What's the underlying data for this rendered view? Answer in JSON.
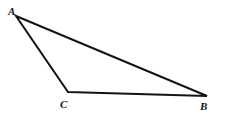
{
  "figure": {
    "name": "triangle-abc",
    "width": 225,
    "height": 119,
    "background_color": "#ffffff",
    "stroke_color": "#141414",
    "stroke_width": 2,
    "vertices": [
      {
        "id": "A",
        "label": "A",
        "x": 16,
        "y": 16,
        "label_x": 8,
        "label_y": 6
      },
      {
        "id": "B",
        "label": "B",
        "x": 207,
        "y": 96,
        "label_x": 200,
        "label_y": 101
      },
      {
        "id": "C",
        "label": "C",
        "x": 68,
        "y": 92,
        "label_x": 60,
        "label_y": 99
      }
    ],
    "edges": [
      {
        "id": "AB",
        "from": "A",
        "to": "B"
      },
      {
        "id": "BC",
        "from": "B",
        "to": "C"
      },
      {
        "id": "CA",
        "from": "C",
        "to": "A"
      }
    ],
    "path": "M 16 16 L 207 96 L 68 92 Z"
  }
}
